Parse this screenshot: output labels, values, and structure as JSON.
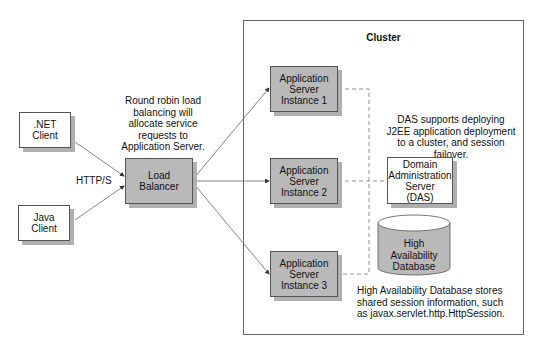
{
  "cluster": {
    "title": "Cluster"
  },
  "clients": [
    {
      "label_line1": ".NET",
      "label_line2": "Client"
    },
    {
      "label_line1": "Java",
      "label_line2": "Client"
    }
  ],
  "protocol_label": "HTTP/S",
  "load_balancer": {
    "line1": "Load",
    "line2": "Balancer"
  },
  "round_robin_note": [
    "Round robin load",
    "balancing will",
    "allocate service",
    "requests to",
    "Application Server."
  ],
  "app_servers": [
    {
      "line1": "Application",
      "line2": "Server",
      "line3": "Instance 1"
    },
    {
      "line1": "Application",
      "line2": "Server",
      "line3": "Instance 2"
    },
    {
      "line1": "Application",
      "line2": "Server",
      "line3": "Instance 3"
    }
  ],
  "das_note": [
    "DAS supports deploying",
    "J2EE application deployment",
    "to a cluster, and session failover."
  ],
  "das": {
    "line1": "Domain",
    "line2": "Administration",
    "line3": "Server",
    "line4": "(DAS)"
  },
  "database": {
    "line1": "High",
    "line2": "Availability",
    "line3": "Database"
  },
  "db_note": [
    "High Availability Database stores",
    "shared session information, such",
    "as javax.servlet.http.HttpSession."
  ],
  "colors": {
    "box_gray": "#b9b9b9",
    "shadow": "#b0b0b0",
    "line": "#555555"
  }
}
